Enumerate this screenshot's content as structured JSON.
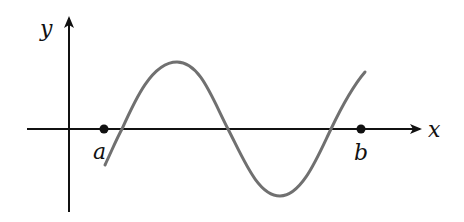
{
  "diagram": {
    "labels": {
      "x_axis": "x",
      "y_axis": "y",
      "point_a": "a",
      "point_b": "b"
    },
    "colors": {
      "axes": "#111111",
      "curve": "#707070",
      "points": "#111111"
    },
    "geometry": {
      "x_axis_y": 129,
      "y_axis_x": 69,
      "point_a_x": 104,
      "point_b_x": 361,
      "curve_start": [
        105,
        165
      ],
      "curve_peak": [
        177,
        62
      ],
      "curve_trough": [
        280,
        196
      ],
      "curve_end": [
        365,
        72
      ],
      "zero_crossings_x": [
        122,
        228,
        331
      ]
    }
  }
}
